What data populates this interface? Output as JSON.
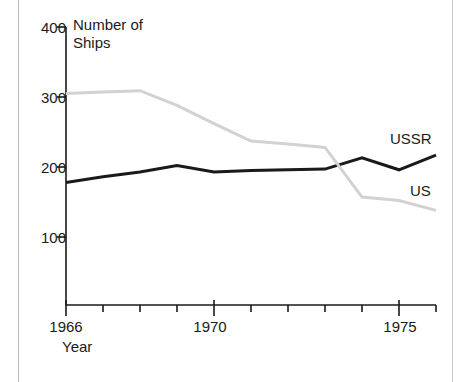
{
  "figure": {
    "background": "#ffffff",
    "frame_color": "#b9b9b9"
  },
  "chart_data": {
    "type": "line",
    "title": "Number of\nShips",
    "xlabel": "Year",
    "ylabel": "Number of Ships",
    "xlim": [
      1966,
      1976
    ],
    "ylim": [
      0,
      400
    ],
    "grid": false,
    "legend": "inline-right",
    "y_ticks": [
      100,
      200,
      300,
      400
    ],
    "y_tick_labels": [
      "100",
      "200",
      "300",
      "400"
    ],
    "x_ticks": [
      1966,
      1967,
      1968,
      1969,
      1970,
      1971,
      1972,
      1973,
      1974,
      1975,
      1976
    ],
    "x_tick_labels": [
      "1966",
      "",
      "",
      "",
      "1970",
      "",
      "",
      "",
      "",
      "1975",
      ""
    ],
    "x": [
      1966,
      1967,
      1968,
      1969,
      1970,
      1971,
      1972,
      1973,
      1974,
      1975,
      1976
    ],
    "series": [
      {
        "name": "USSR",
        "color": "#1a1a1a",
        "width": 3,
        "label_text": "USSR",
        "values": [
          178,
          186,
          193,
          202,
          193,
          195,
          196,
          197,
          213,
          196,
          217
        ]
      },
      {
        "name": "US",
        "color": "#d2d2d2",
        "width": 3,
        "label_text": "US",
        "values": [
          305,
          307,
          309,
          288,
          262,
          237,
          233,
          228,
          157,
          152,
          138
        ]
      }
    ]
  },
  "annotations": {
    "title_text": "Number of\nShips",
    "year_caption": "Year",
    "ussr_label": "USSR",
    "us_label": "US"
  }
}
